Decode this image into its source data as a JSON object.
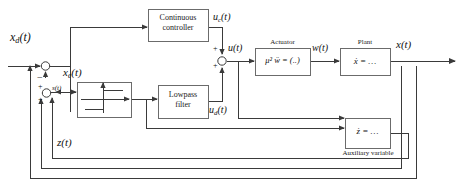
{
  "diagram": {
    "width": 475,
    "height": 190,
    "line_color": "#3a3a3a",
    "block_border_color": "#6b6b6b",
    "text_color": "#111111"
  },
  "blocks": {
    "continuous_controller": {
      "line1": "Continuous",
      "line2": "controller"
    },
    "relay": {
      "caption": ""
    },
    "lowpass_filter": {
      "line1": "Lowpass",
      "line2": "filter"
    },
    "actuator": {
      "caption": "Actuator",
      "equation": "μ² ẅ = (..)"
    },
    "plant": {
      "caption": "Plant",
      "equation": "ẋ = …"
    },
    "auxiliary": {
      "caption": "Auxiliary variable",
      "equation": "ż = …"
    }
  },
  "signals": {
    "x_d": {
      "base": "x",
      "sub": "d",
      "arg": "(t)"
    },
    "x_e": {
      "base": "x",
      "sub": "e",
      "arg": "(t)"
    },
    "u_c": {
      "base": "u",
      "sub": "c",
      "arg": "(t)"
    },
    "u_d": {
      "base": "u",
      "sub": "d",
      "arg": "(t)"
    },
    "u": {
      "base": "u",
      "sub": "",
      "arg": "(t)"
    },
    "w": {
      "base": "w",
      "sub": "",
      "arg": "(t)"
    },
    "x": {
      "base": "x",
      "sub": "",
      "arg": "(t)"
    },
    "z": {
      "base": "z",
      "sub": "",
      "arg": "(t)"
    },
    "s": {
      "base": "s",
      "sub": "",
      "arg": "(t)"
    }
  },
  "summing_signs": {
    "error_minus": "−",
    "relay_plus_top": "+",
    "relay_plus_bottom": "+",
    "u_plus_top": "+",
    "u_plus_bottom": "+"
  }
}
